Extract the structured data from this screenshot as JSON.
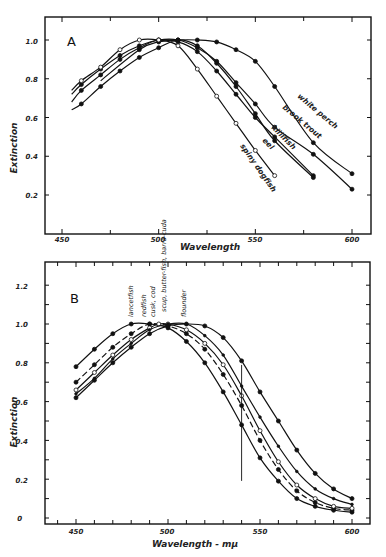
{
  "chart_data": [
    {
      "panel": "A",
      "type": "line",
      "title": "A",
      "xlabel": "Wavelength",
      "ylabel": "Extinction",
      "xlim": [
        440,
        607
      ],
      "ylim": [
        0,
        1.1
      ],
      "x_ticks": [
        450,
        500,
        550,
        600
      ],
      "y_ticks": [
        0.2,
        0.4,
        0.6,
        0.8,
        1.0
      ],
      "grid": false,
      "legend": "inline curve labels",
      "series": [
        {
          "name": "white perch",
          "marker": "filled",
          "x": [
            470,
            490,
            500,
            510,
            520,
            530,
            540,
            550,
            560,
            580,
            600
          ],
          "y": [
            0.79,
            0.95,
            0.99,
            1.0,
            1.0,
            0.99,
            0.95,
            0.89,
            0.76,
            0.47,
            0.31
          ]
        },
        {
          "name": "brook trout",
          "marker": "filled",
          "x": [
            455,
            460,
            470,
            480,
            490,
            500,
            510,
            520,
            530,
            540,
            550,
            560,
            580,
            600
          ],
          "y": [
            0.72,
            0.77,
            0.85,
            0.92,
            0.97,
            1.0,
            1.0,
            0.96,
            0.89,
            0.78,
            0.67,
            0.55,
            0.41,
            0.23
          ]
        },
        {
          "name": "killifish",
          "marker": "filled",
          "x": [
            455,
            460,
            470,
            480,
            490,
            500,
            510,
            520,
            530,
            540,
            550,
            560,
            580
          ],
          "y": [
            0.68,
            0.74,
            0.82,
            0.9,
            0.96,
            1.0,
            0.99,
            0.94,
            0.84,
            0.72,
            0.6,
            0.5,
            0.3
          ]
        },
        {
          "name": "eel",
          "marker": "filled",
          "x": [
            455,
            460,
            470,
            480,
            490,
            500,
            510,
            520,
            530,
            540,
            550,
            560,
            580
          ],
          "y": [
            0.64,
            0.67,
            0.76,
            0.84,
            0.91,
            0.96,
            1.0,
            0.97,
            0.88,
            0.76,
            0.62,
            0.48,
            0.29
          ]
        },
        {
          "name": "spiny dogfish",
          "marker": "open",
          "x": [
            455,
            460,
            470,
            480,
            490,
            500,
            510,
            520,
            530,
            540,
            550,
            560
          ],
          "y": [
            0.74,
            0.79,
            0.86,
            0.95,
            1.0,
            1.0,
            0.97,
            0.85,
            0.71,
            0.57,
            0.43,
            0.3
          ]
        }
      ]
    },
    {
      "panel": "B",
      "type": "line",
      "title": "B",
      "xlabel": "Wavelength - mμ",
      "ylabel": "Extinction",
      "xlim": [
        440,
        608
      ],
      "ylim": [
        -0.03,
        1.3
      ],
      "x_ticks": [
        450,
        500,
        550,
        600
      ],
      "y_ticks": [
        0,
        0.2,
        0.4,
        0.6,
        0.8,
        1.0,
        1.2
      ],
      "grid": false,
      "annotations": [
        "vertical line at 540",
        "peak labels above curves"
      ],
      "series": [
        {
          "name": "lancetfish",
          "style": "solid",
          "marker": "filled",
          "x": [
            450,
            460,
            470,
            480,
            490,
            500,
            510,
            520,
            530,
            540,
            550,
            560,
            570,
            580,
            590,
            600
          ],
          "y": [
            0.78,
            0.87,
            0.95,
            1.0,
            1.0,
            0.98,
            0.91,
            0.8,
            0.65,
            0.48,
            0.31,
            0.19,
            0.1,
            0.06,
            0.04,
            0.03
          ]
        },
        {
          "name": "redfish",
          "style": "dashed",
          "marker": "filled",
          "x": [
            450,
            460,
            470,
            480,
            490,
            500,
            510,
            520,
            530,
            540,
            550,
            560,
            570,
            580,
            590,
            600
          ],
          "y": [
            0.7,
            0.79,
            0.88,
            0.95,
            1.0,
            0.99,
            0.95,
            0.87,
            0.74,
            0.58,
            0.4,
            0.25,
            0.14,
            0.08,
            0.05,
            0.04
          ]
        },
        {
          "name": "cusk, cod",
          "style": "solid",
          "marker": "open",
          "x": [
            450,
            460,
            470,
            480,
            490,
            495,
            500,
            510,
            520,
            530,
            540,
            550,
            560,
            570,
            580,
            590,
            600
          ],
          "y": [
            0.66,
            0.75,
            0.84,
            0.92,
            0.98,
            1.0,
            1.0,
            0.97,
            0.9,
            0.79,
            0.63,
            0.45,
            0.29,
            0.17,
            0.1,
            0.06,
            0.05
          ]
        },
        {
          "name": "scup, butterfish, barracuda",
          "style": "solid",
          "marker": "small",
          "x": [
            450,
            460,
            470,
            480,
            490,
            500,
            510,
            520,
            530,
            540,
            550,
            560,
            570,
            580,
            590,
            600
          ],
          "y": [
            0.64,
            0.72,
            0.82,
            0.9,
            0.97,
            1.0,
            1.0,
            0.94,
            0.84,
            0.68,
            0.52,
            0.37,
            0.24,
            0.15,
            0.1,
            0.07
          ]
        },
        {
          "name": "flounder",
          "style": "solid",
          "marker": "filled",
          "x": [
            450,
            460,
            470,
            480,
            490,
            500,
            510,
            520,
            530,
            540,
            550,
            560,
            570,
            580,
            590,
            600
          ],
          "y": [
            0.62,
            0.71,
            0.8,
            0.88,
            0.95,
            0.99,
            1.0,
            0.99,
            0.93,
            0.81,
            0.65,
            0.5,
            0.35,
            0.23,
            0.15,
            0.1
          ]
        }
      ]
    }
  ],
  "panels": {
    "a": {
      "letter": "A",
      "xlabel": "Wavelength",
      "ylabel": "Extinction",
      "x_tick_labels": [
        "450",
        "500",
        "550",
        "600"
      ],
      "y_tick_labels": [
        "0.2",
        "0.4",
        "0.6",
        "0.8",
        "1.0"
      ],
      "curve_labels": [
        "white perch",
        "brook trout",
        "killifish",
        "eel",
        "spiny dogfish"
      ]
    },
    "b": {
      "letter": "B",
      "xlabel": "Wavelength - mμ",
      "ylabel": "Extinction",
      "x_tick_labels": [
        "450",
        "500",
        "550",
        "600"
      ],
      "y_tick_labels": [
        "0",
        "0.2",
        "0.4",
        "0.6",
        "0.8",
        "1.0",
        "1.2"
      ],
      "peak_labels": [
        "lancetfish",
        "redfish",
        "cusk, cod",
        "scup, butter-fish, barra-cuda",
        "flounder"
      ]
    }
  }
}
